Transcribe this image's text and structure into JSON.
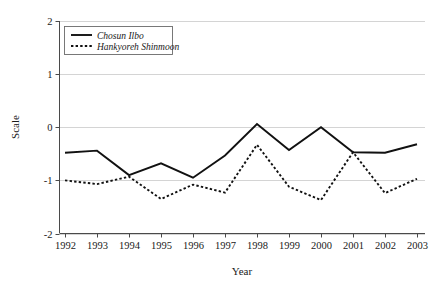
{
  "chart_data": {
    "type": "line",
    "title": "",
    "xlabel": "Year",
    "ylabel": "Scale",
    "categories": [
      "1992",
      "1993",
      "1994",
      "1995",
      "1996",
      "1997",
      "1998",
      "1999",
      "2000",
      "2001",
      "2002",
      "2003"
    ],
    "xlim": [
      1992,
      2003
    ],
    "ylim": [
      -2,
      2
    ],
    "yticks": [
      "2",
      "1",
      "0",
      "-1",
      "-2"
    ],
    "ytick_values": [
      2,
      1,
      0,
      -1,
      -2
    ],
    "grid": "horizontal",
    "legend_position": "top-left",
    "series": [
      {
        "name": "Chosun Ilbo",
        "style": "solid",
        "color": "#111111",
        "values": [
          -0.48,
          -0.44,
          -0.9,
          -0.68,
          -0.95,
          -0.53,
          0.06,
          -0.43,
          0.0,
          -0.47,
          -0.48,
          -0.32
        ]
      },
      {
        "name": "Hankyoreh Shinmoon",
        "style": "dotted",
        "color": "#111111",
        "values": [
          -1.0,
          -1.07,
          -0.93,
          -1.35,
          -1.08,
          -1.23,
          -0.33,
          -1.12,
          -1.37,
          -0.47,
          -1.24,
          -0.97
        ]
      }
    ]
  },
  "legend": {
    "items": [
      {
        "label": "Chosun Ilbo"
      },
      {
        "label": "Hankyoreh Shinmoon"
      }
    ]
  },
  "axes": {
    "x_title": "Year",
    "y_title": "Scale"
  }
}
